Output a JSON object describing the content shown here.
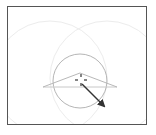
{
  "canvas": {
    "width": 156,
    "height": 135,
    "background": "#ffffff",
    "frame": {
      "x": 7,
      "y": 6,
      "w": 140,
      "h": 119,
      "color": "#555555"
    }
  },
  "shapes": {
    "arc_left": {
      "cx": 50,
      "cy": 78,
      "r": 57,
      "color": "#ececec"
    },
    "arc_right": {
      "cx": 107,
      "cy": 78,
      "r": 57,
      "color": "#ececec"
    },
    "circle": {
      "cx": 80,
      "cy": 81,
      "r": 27,
      "color": "#b5b5b5"
    },
    "triangle": {
      "points": "43,87 80,73 117,87",
      "color": "#b8b8b8"
    },
    "baseline": {
      "x1": 43,
      "y1": 87,
      "x2": 117,
      "y2": 87,
      "color": "#c8c8c8"
    },
    "crosshair": {
      "cx": 81,
      "cy": 80,
      "size": 6,
      "color": "#333333"
    },
    "arrow": {
      "x1": 82,
      "y1": 84,
      "x2": 104,
      "y2": 106,
      "color": "#333333"
    }
  },
  "icons": {
    "crosshair": "crosshair-icon",
    "arrow": "arrow-vector-icon"
  }
}
